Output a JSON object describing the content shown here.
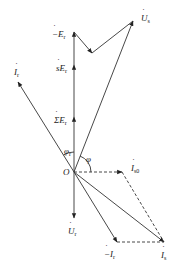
{
  "diagram": {
    "type": "phasor-diagram",
    "origin": {
      "label": "O",
      "x": 74,
      "y": 172
    },
    "colors": {
      "line": "#333333",
      "dashed": "#444444",
      "text": "#222222",
      "background": "#ffffff"
    },
    "vectors": [
      {
        "id": "Us",
        "label": "U",
        "sub": "s",
        "dotted": true,
        "from": [
          74,
          172
        ],
        "to": [
          133,
          21
        ]
      },
      {
        "id": "sumEr",
        "label": "ΣE",
        "sub": "r",
        "dotted": true,
        "from": [
          74,
          172
        ],
        "to": [
          74,
          117
        ]
      },
      {
        "id": "sEr",
        "label": "sE",
        "sub": "r",
        "dotted": true,
        "from": [
          74,
          117
        ],
        "to": [
          74,
          65
        ]
      },
      {
        "id": "negEr",
        "label": "−E",
        "sub": "r",
        "dotted": true,
        "from": [
          74,
          65
        ],
        "to": [
          74,
          32
        ]
      },
      {
        "id": "zig1",
        "from": [
          74,
          32
        ],
        "to": [
          92,
          53
        ]
      },
      {
        "id": "zig2",
        "from": [
          92,
          53
        ],
        "to": [
          133,
          21
        ]
      },
      {
        "id": "Ir",
        "label": "I",
        "sub": "r",
        "dotted": true,
        "from": [
          74,
          172
        ],
        "to": [
          18,
          82
        ]
      },
      {
        "id": "Ur",
        "label": "U",
        "sub": "r",
        "dotted": true,
        "from": [
          74,
          172
        ],
        "to": [
          74,
          218
        ]
      },
      {
        "id": "negIr",
        "label": "−I",
        "sub": "r",
        "dotted": true,
        "from": [
          74,
          172
        ],
        "to": [
          117,
          242
        ]
      },
      {
        "id": "Is",
        "label": "I",
        "sub": "s",
        "dotted": true,
        "from": [
          74,
          172
        ],
        "to": [
          164,
          242
        ]
      },
      {
        "id": "Is0",
        "label": "I",
        "sub": "s0",
        "dotted": true,
        "from": [
          74,
          172
        ],
        "to": [
          122,
          172
        ],
        "dashed": true
      }
    ],
    "dashed_lines": [
      {
        "from": [
          122,
          172
        ],
        "to": [
          164,
          242
        ]
      },
      {
        "from": [
          117,
          242
        ],
        "to": [
          164,
          242
        ]
      }
    ],
    "angles": [
      {
        "label": "φ",
        "sub": "r"
      },
      {
        "label": "φ",
        "sub": ""
      }
    ],
    "labels": {
      "Us": {
        "text": "U",
        "sub": "s"
      },
      "negEr": {
        "text": "−E",
        "sub": "r"
      },
      "sEr": {
        "text": "sE",
        "sub": "r"
      },
      "Ir": {
        "text": "I",
        "sub": "r"
      },
      "sumEr": {
        "text": "ΣE",
        "sub": "r"
      },
      "phi_r": {
        "text": "φ",
        "sub": "r"
      },
      "phi": {
        "text": "φ",
        "sub": ""
      },
      "origin": {
        "text": "O",
        "sub": ""
      },
      "Is0": {
        "text": "I",
        "sub": "s0"
      },
      "Ur": {
        "text": "U",
        "sub": "r"
      },
      "negIr": {
        "text": "−I",
        "sub": "r"
      },
      "Is": {
        "text": "I",
        "sub": "s"
      }
    }
  }
}
